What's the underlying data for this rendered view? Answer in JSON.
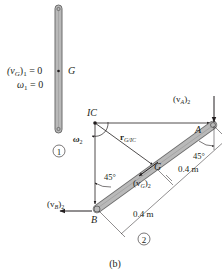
{
  "figure": {
    "caption": "(b)",
    "state1": {
      "label_vG": "(v",
      "label_vG_sub": "G",
      "label_vG_tail": ")",
      "label_vG_sub2": "1",
      "label_vG_value": " = 0",
      "label_omega": "ω",
      "label_omega_sub": "1",
      "label_omega_value": " = 0",
      "label_G": "G",
      "position_number": "1"
    },
    "state2": {
      "label_IC": "IC",
      "label_A": "A",
      "label_B": "B",
      "label_G": "G",
      "label_omega2": "ω",
      "label_omega2_sub": "2",
      "label_r": "r",
      "label_r_sub": "G/IC",
      "label_vA": "(v",
      "label_vA_sub": "A",
      "label_vA_tail": ")",
      "label_vA_sub2": "2",
      "label_vB": "(v",
      "label_vB_sub": "B",
      "label_vB_tail": ")",
      "label_vB_sub2": "2",
      "label_vG": "(v",
      "label_vG_sub": "G",
      "label_vG_tail": ")",
      "label_vG_sub2": "2",
      "angle_top": "45°",
      "angle_left": "45°",
      "dim_upper": "0.4 m",
      "dim_lower": "0.4 m",
      "position_number": "2"
    },
    "colors": {
      "bar_fill": "#b9b9b9",
      "bar_stroke": "#6d6d6d",
      "line": "#231f20"
    }
  }
}
